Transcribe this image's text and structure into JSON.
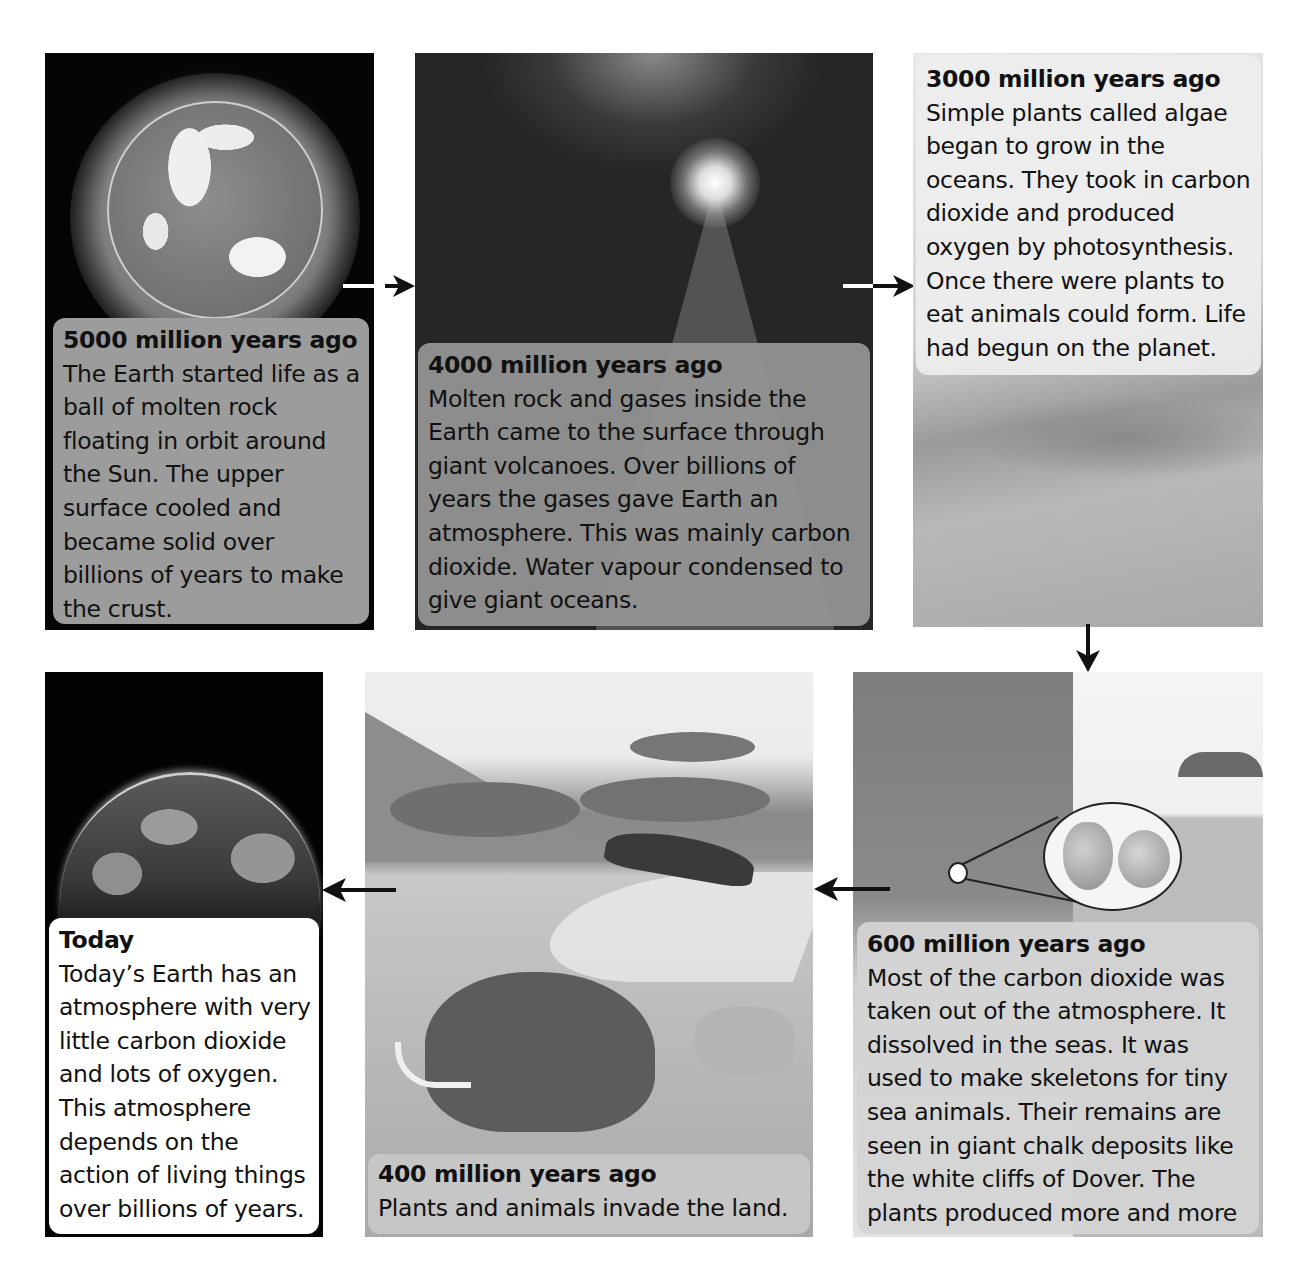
{
  "diagram": {
    "type": "timeline",
    "topic": "Evolution of Earth's atmosphere",
    "flow_order": [
      "5000",
      "4000",
      "3000",
      "600",
      "400",
      "today"
    ]
  },
  "panels": {
    "p5000": {
      "title": "5000 million years ago",
      "text": "The Earth started life as a ball of molten rock floating in orbit around the Sun. The upper surface cooled and became solid over billions of years to make the crust.",
      "image": "molten-earth-globe"
    },
    "p4000": {
      "title": "4000 million years ago",
      "text": "Molten rock and gases inside the Earth came to the surface through giant volcanoes. Over billions of years the gases gave Earth an atmosphere. This was mainly carbon dioxide. Water vapour condensed to give giant oceans.",
      "image": "erupting-volcano"
    },
    "p3000": {
      "title": "3000 million years ago",
      "text": "Simple plants called algae began to grow in the oceans. They took in carbon dioxide and produced oxygen by photosynthesis. Once there were plants to eat animals could form. Life had begun on the planet.",
      "image": "algae-ocean-clouds"
    },
    "p600": {
      "title": "600 million years ago",
      "text": "Most of the carbon dioxide was taken out of the atmosphere. It dissolved in the seas. It was used to make skeletons for tiny sea animals. Their remains are seen in giant chalk deposits like the white cliffs of Dover. The plants produced more and more oxygen.",
      "image": "chalk-cliffs-with-fossil-magnifier"
    },
    "p400": {
      "title": "400 million years ago",
      "text": "Plants and animals invade the land.",
      "image": "savanna-mammoth-eagle-wolf"
    },
    "today": {
      "title": "Today",
      "text": "Today’s Earth has an atmosphere with very little carbon dioxide and lots of oxygen. This atmosphere depends on the action of living things over billions of years.",
      "image": "modern-earth-horizon"
    }
  },
  "arrows": [
    {
      "from": "p5000",
      "to": "p4000",
      "direction": "right"
    },
    {
      "from": "p4000",
      "to": "p3000",
      "direction": "right"
    },
    {
      "from": "p3000",
      "to": "p600",
      "direction": "down"
    },
    {
      "from": "p600",
      "to": "p400",
      "direction": "left"
    },
    {
      "from": "p400",
      "to": "today",
      "direction": "left"
    }
  ],
  "colors": {
    "arrow": "#111111",
    "caption_dark": "#9c9c9c",
    "caption_light": "#eeeeee",
    "caption_today": "#ffffff",
    "space": "#050505"
  }
}
